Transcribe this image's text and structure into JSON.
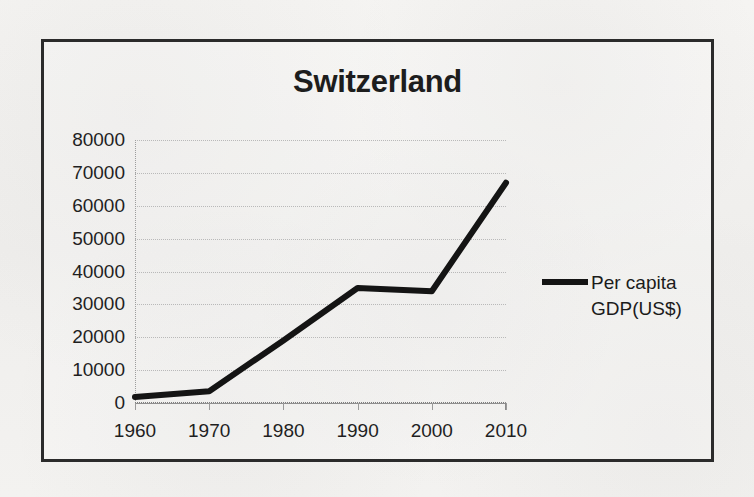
{
  "chart_data": {
    "type": "line",
    "title": "Switzerland",
    "xlabel": "",
    "ylabel": "",
    "x": [
      1960,
      1970,
      1980,
      1990,
      2000,
      2010
    ],
    "categories": [
      "1960",
      "1970",
      "1980",
      "1990",
      "2000",
      "2010"
    ],
    "series": [
      {
        "name": "Per capita GDP(US$)",
        "values": [
          1800,
          3600,
          19000,
          35000,
          34000,
          67000
        ]
      }
    ],
    "xlim": [
      1960,
      2010
    ],
    "ylim": [
      0,
      80000
    ],
    "y_ticks": [
      0,
      10000,
      20000,
      30000,
      40000,
      50000,
      60000,
      70000,
      80000
    ],
    "y_tick_labels": [
      "0",
      "10000",
      "20000",
      "30000",
      "40000",
      "50000",
      "60000",
      "70000",
      "80000"
    ],
    "x_ticks": [
      1960,
      1970,
      1980,
      1990,
      2000,
      2010
    ],
    "x_tick_labels": [
      "1960",
      "1970",
      "1980",
      "1990",
      "2000",
      "2010"
    ],
    "grid": true,
    "grid_axis": "y",
    "legend_position": "right",
    "line_color": "#141414",
    "line_width": 6
  },
  "legend": {
    "entries": [
      {
        "label": "Per capita GDP(US$)",
        "color": "#141414"
      }
    ]
  },
  "colors": {
    "frame": "#2b2b2b",
    "line": "#141414",
    "grid": "#b9b9b9",
    "text": "#1f1f1f",
    "background": "#f2f1ef"
  }
}
